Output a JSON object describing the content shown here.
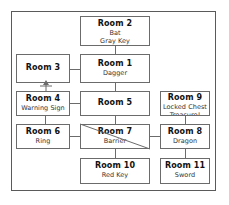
{
  "diagram": {
    "frame": {
      "label": "map-border"
    },
    "rooms": [
      {
        "id": "room1",
        "title": "Room 1",
        "lines": [
          "Dagger"
        ]
      },
      {
        "id": "room2",
        "title": "Room 2",
        "lines": [
          "Bat",
          "Gray Key"
        ]
      },
      {
        "id": "room3",
        "title": "Room 3",
        "lines": []
      },
      {
        "id": "room4",
        "title": "Room 4",
        "lines": [
          "Warning Sign"
        ]
      },
      {
        "id": "room5",
        "title": "Room 5",
        "lines": []
      },
      {
        "id": "room6",
        "title": "Room 6",
        "lines": [
          "Ring"
        ]
      },
      {
        "id": "room7",
        "title": "Room 7",
        "lines": [
          "Barrier"
        ]
      },
      {
        "id": "room8",
        "title": "Room 8",
        "lines": [
          "Dragon"
        ]
      },
      {
        "id": "room9",
        "title": "Room 9",
        "lines": [
          "Locked Chest",
          "Treasure!"
        ]
      },
      {
        "id": "room10",
        "title": "Room 10",
        "lines": [
          "Red Key"
        ]
      },
      {
        "id": "room11",
        "title": "Room 11",
        "lines": [
          "Sword"
        ]
      }
    ],
    "connections": [
      {
        "from": "room2",
        "to": "room1",
        "type": "vertical"
      },
      {
        "from": "room3",
        "to": "room1",
        "type": "horizontal"
      },
      {
        "from": "room4",
        "to": "room3",
        "type": "one-way-up"
      },
      {
        "from": "room4",
        "to": "room5",
        "type": "horizontal"
      },
      {
        "from": "room1",
        "to": "room5",
        "type": "vertical"
      },
      {
        "from": "room5",
        "to": "room7",
        "type": "vertical"
      },
      {
        "from": "room4",
        "to": "room6",
        "type": "vertical"
      },
      {
        "from": "room6",
        "to": "room7",
        "type": "horizontal"
      },
      {
        "from": "room7",
        "to": "room8",
        "type": "horizontal"
      },
      {
        "from": "room9",
        "to": "room8",
        "type": "vertical"
      },
      {
        "from": "room7",
        "to": "room10",
        "type": "vertical"
      },
      {
        "from": "room8",
        "to": "room11",
        "type": "vertical"
      }
    ],
    "colors": {
      "line": "#6b6b6b",
      "frame": "#5a5a5a",
      "text": "#111111",
      "subtext": "#333333",
      "background": "#ffffff"
    }
  }
}
